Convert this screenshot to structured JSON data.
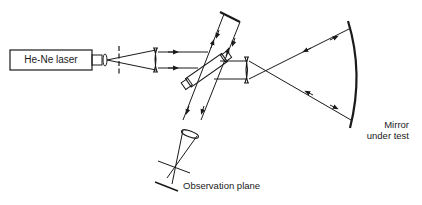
{
  "diagram": {
    "components": {
      "laser": {
        "label": "He-Ne laser"
      },
      "observation_plane": {
        "label": "Observation plane"
      },
      "mirror_under_test": {
        "label_line1": "Mirror",
        "label_line2": "under test"
      }
    },
    "colors": {
      "stroke": "#1a1a1a",
      "background": "#ffffff"
    }
  }
}
